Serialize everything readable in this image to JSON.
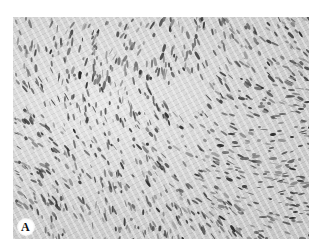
{
  "figure": {
    "panel_label": "A",
    "image_description": "grayscale histology micrograph showing densely packed spindle-shaped cells in interlacing fascicles",
    "colors": {
      "background": "#ffffff",
      "tissue_light": "#e6e6e6",
      "tissue_mid": "#cfcfcf",
      "nucleus_dark": "#3a3a3a"
    }
  }
}
